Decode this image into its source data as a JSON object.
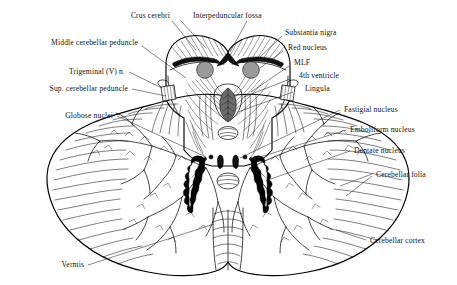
{
  "figure": {
    "background_color": "#ffffff",
    "ink_color": "#000000",
    "nucleus_fill_color": "#9a9a9a",
    "lingula_fill_color": "#6d6d6d"
  },
  "labels": {
    "crus_cerebri": "Crus cerebri",
    "interpeduncular_fossa": "Interpeduncular fossa",
    "substantia_nigra": "Substantia nigra",
    "red_nucleus": "Red nucleus",
    "mlf": "MLF",
    "fourth_ventricle": "4th ventricle",
    "lingula": "Lingula",
    "fastigial_nucleus": "Fastigial nucleus",
    "emboliform_nucleus": "Emboliform nucleus",
    "dentate_nucleus": "Dentate nucleus",
    "cerebellar_folia": "Cerebellar folia",
    "cerebellar_cortex": "Cerebellar cortex",
    "middle_cerebellar_peduncle": "Middle cerebellar peduncle",
    "trigeminal_nerve": "Trigeminal (V) n.",
    "sup_cerebellar_peduncle": "Sup. cerebellar peduncle",
    "globose_nuclei": "Globose nuclei",
    "vermis": "Vermis"
  },
  "label_list": [
    {
      "key": "crus_cerebri",
      "text": "Crus cerebri",
      "side": "top"
    },
    {
      "key": "interpeduncular_fossa",
      "text": "Interpeduncular fossa",
      "side": "top"
    },
    {
      "key": "substantia_nigra",
      "text": "Substantia nigra",
      "side": "right"
    },
    {
      "key": "red_nucleus",
      "text": "Red nucleus",
      "side": "right"
    },
    {
      "key": "mlf",
      "text": "MLF",
      "side": "right"
    },
    {
      "key": "fourth_ventricle",
      "text": "4th ventricle",
      "side": "right"
    },
    {
      "key": "lingula",
      "text": "Lingula",
      "side": "right"
    },
    {
      "key": "fastigial_nucleus",
      "text": "Fastigial nucleus",
      "side": "right"
    },
    {
      "key": "emboliform_nucleus",
      "text": "Emboliform nucleus",
      "side": "right"
    },
    {
      "key": "dentate_nucleus",
      "text": "Dentate nucleus",
      "side": "right"
    },
    {
      "key": "cerebellar_folia",
      "text": "Cerebellar folia",
      "side": "right"
    },
    {
      "key": "cerebellar_cortex",
      "text": "Cerebellar cortex",
      "side": "right"
    },
    {
      "key": "middle_cerebellar_peduncle",
      "text": "Middle cerebellar peduncle",
      "side": "left"
    },
    {
      "key": "trigeminal_nerve",
      "text": "Trigeminal (V) n.",
      "side": "left"
    },
    {
      "key": "sup_cerebellar_peduncle",
      "text": "Sup. cerebellar peduncle",
      "side": "left"
    },
    {
      "key": "globose_nuclei",
      "text": "Globose nuclei",
      "side": "left"
    },
    {
      "key": "vermis",
      "text": "Vermis",
      "side": "bottom-left"
    }
  ]
}
